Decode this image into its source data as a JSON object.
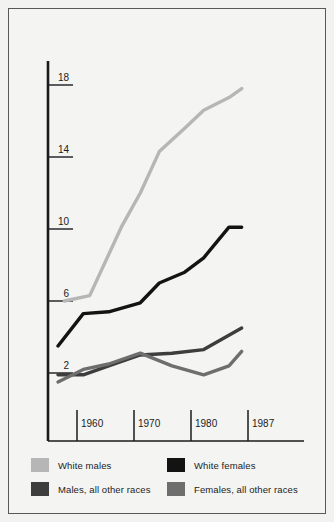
{
  "chart_data": {
    "type": "line",
    "title": "",
    "xlabel": "",
    "ylabel": "",
    "xlim": [
      1955,
      1989
    ],
    "ylim": [
      0,
      20
    ],
    "grid": false,
    "legend_position": "bottom",
    "yticks": [
      "2",
      "6",
      "10",
      "14",
      "18"
    ],
    "ytick_values": [
      2,
      6,
      10,
      14,
      18
    ],
    "xticks": [
      "1960",
      "1970",
      "1980",
      "1987"
    ],
    "xtick_values": [
      1960,
      1970,
      1980,
      1987
    ],
    "series": [
      {
        "name": "White males",
        "color": "#b6b6b6",
        "x": [
          1958,
          1962,
          1967,
          1970,
          1973,
          1977,
          1980,
          1984,
          1986
        ],
        "values": [
          6.0,
          6.3,
          10.1,
          12.0,
          14.3,
          15.6,
          16.6,
          17.3,
          17.8
        ]
      },
      {
        "name": "White females",
        "color": "#131313",
        "x": [
          1957,
          1961,
          1965,
          1970,
          1973,
          1977,
          1980,
          1984,
          1986
        ],
        "values": [
          3.5,
          5.3,
          5.4,
          5.9,
          7.0,
          7.6,
          8.4,
          10.1,
          10.1
        ]
      },
      {
        "name": "Males, all other races",
        "color": "#3d3d3d",
        "x": [
          1957,
          1961,
          1965,
          1970,
          1975,
          1980,
          1986
        ],
        "values": [
          1.9,
          1.9,
          2.4,
          3.0,
          3.1,
          3.3,
          4.5
        ]
      },
      {
        "name": "Females, all other races",
        "color": "#6e6e6e",
        "x": [
          1957,
          1961,
          1965,
          1970,
          1975,
          1980,
          1984,
          1986
        ],
        "values": [
          1.5,
          2.2,
          2.5,
          3.1,
          2.4,
          1.9,
          2.4,
          3.2
        ]
      }
    ]
  },
  "legend": {
    "items": [
      {
        "label": "White males",
        "color": "#b6b6b6"
      },
      {
        "label": "White females",
        "color": "#131313"
      },
      {
        "label": "Males, all other races",
        "color": "#3d3d3d"
      },
      {
        "label": "Females, all other races",
        "color": "#6e6e6e"
      }
    ]
  },
  "axis": {
    "y_ticks": [
      "18",
      "14",
      "10",
      "6",
      "2"
    ],
    "x_ticks": [
      "1960",
      "1970",
      "1980",
      "1987"
    ]
  },
  "colors": {
    "page_background": "#f2f2f1",
    "panel_background": "#f4f4f3",
    "frame_border": "#58585a",
    "axis": "#1b1b1b",
    "text": "#1b1b1b"
  }
}
